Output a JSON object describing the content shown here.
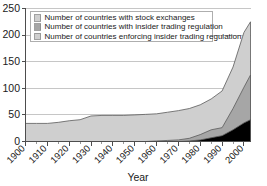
{
  "chart_data": {
    "type": "area",
    "title": "",
    "xlabel": "Year",
    "ylabel": "",
    "xlim": [
      1900,
      2003
    ],
    "ylim": [
      0,
      250
    ],
    "grid": true,
    "legend_position": "top-left",
    "stacked": false,
    "x": [
      1900,
      1905,
      1910,
      1915,
      1920,
      1925,
      1930,
      1935,
      1940,
      1945,
      1950,
      1955,
      1960,
      1965,
      1970,
      1975,
      1980,
      1985,
      1990,
      1995,
      2000,
      2003
    ],
    "series": [
      {
        "name": "Number of countries with stock exchanges",
        "color": "#cfcfcf",
        "values": [
          34,
          34,
          34,
          36,
          39,
          41,
          48,
          49,
          49,
          49,
          50,
          51,
          52,
          55,
          58,
          62,
          69,
          80,
          95,
          140,
          205,
          225
        ]
      },
      {
        "name": "Number of countries with insider trading regulation",
        "color": "#a6a6a6",
        "values": [
          0,
          0,
          0,
          0,
          0,
          0,
          0,
          0,
          0,
          0,
          0,
          0,
          1,
          2,
          3,
          6,
          13,
          22,
          26,
          62,
          102,
          125
        ]
      },
      {
        "name": "Number of countries enforcing insider trading regulation",
        "color": "#000000",
        "values": [
          0,
          0,
          0,
          0,
          0,
          0,
          0,
          0,
          0,
          0,
          0,
          0,
          0,
          0,
          0,
          1,
          3,
          7,
          11,
          22,
          35,
          41
        ]
      }
    ],
    "yticks": [
      0,
      50,
      100,
      150,
      200,
      250
    ],
    "xticks": [
      1900,
      1910,
      1920,
      1930,
      1940,
      1950,
      1960,
      1970,
      1980,
      1990,
      2000
    ],
    "xtick_labels": [
      "1900",
      "1910",
      "1920",
      "1930",
      "1940",
      "1950",
      "1960",
      "1970",
      "1980",
      "1990",
      "2000"
    ],
    "ytick_labels": [
      "0",
      "50",
      "100",
      "150",
      "200",
      "250"
    ],
    "xminor_step": 5
  },
  "legend": {
    "entries": [
      "Number of countries with stock exchanges",
      "Number of countries with insider trading regulation",
      "Number of countries enforcing insider trading regulation"
    ]
  },
  "axes": {
    "xlabel": "Year"
  }
}
